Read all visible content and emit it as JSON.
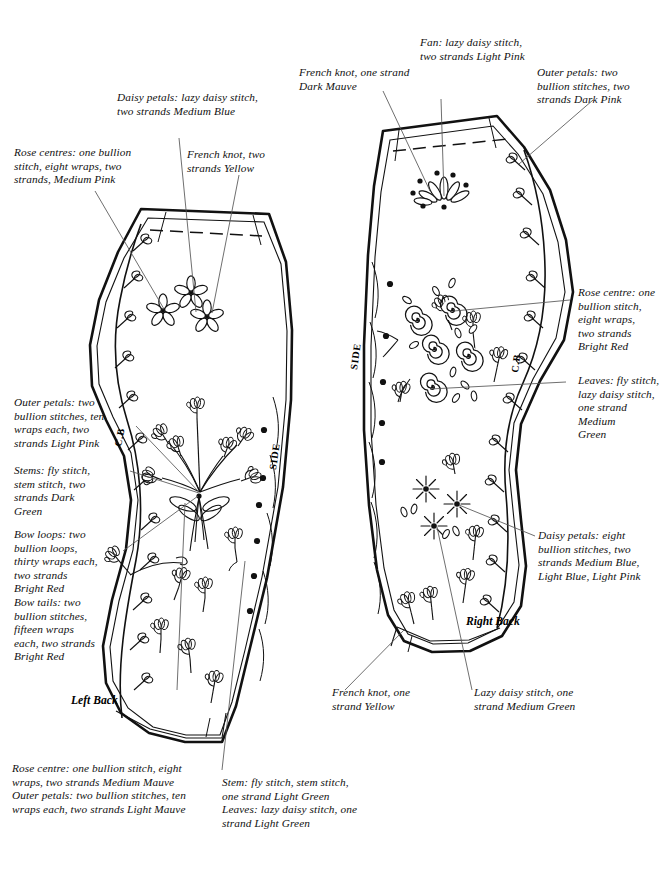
{
  "document": {
    "type": "embroidery-placement-diagram",
    "background_color": "#ffffff",
    "ink_color": "#111111"
  },
  "pieces": [
    {
      "id": "left-back",
      "name": "Left Back",
      "center_back_mark": "C.B",
      "side_mark": "SIDE"
    },
    {
      "id": "right-back",
      "name": "Right Back",
      "center_back_mark": "C.B",
      "side_mark": "SIDE"
    }
  ],
  "labels": {
    "daisy_petals_medium_blue": "Daisy petals: lazy daisy stitch,\ntwo strands Medium Blue",
    "rose_centres_medium_pink": "Rose centres: one bullion\nstitch, eight wraps, two\nstrands, Medium Pink",
    "french_knot_yellow_two": "French knot, two\nstrands Yellow",
    "french_knot_dark_mauve": "French knot, one strand\nDark Mauve",
    "fan_light_pink": "Fan: lazy daisy stitch,\ntwo strands Light Pink",
    "outer_petals_dark_pink": "Outer petals: two\nbullion stitches, two\nstrands Dark Pink",
    "rose_centre_bright_red": "Rose centre: one\nbullion stitch,\neight wraps,\ntwo strands\nBright Red",
    "leaves_medium_green": "Leaves: fly stitch,\nlazy daisy stitch,\none strand Medium\nGreen",
    "outer_petals_light_pink": "Outer petals: two\nbullion stitches, ten\nwraps each, two\nstrands Light Pink",
    "stems_dark_green": "Stems: fly stitch,\nstem stitch, two\nstrands Dark\nGreen",
    "bow_loops_tails_bright_red": "Bow loops: two\nbullion loops,\nthirty wraps each,\ntwo strands\nBright Red\nBow tails: two\nbullion stitches,\nfifteen wraps\neach, two strands\nBright Red",
    "daisy_petals_eight_bullion": "Daisy petals: eight\nbullion stitches, two\nstrands Medium Blue,\nLight Blue, Light Pink",
    "rose_medium_light_mauve": "Rose centre: one bullion stitch, eight\nwraps, two strands Medium Mauve\nOuter petals: two bullion stitches, ten\nwraps each, two strands Light Mauve",
    "stem_leaves_light_green": "Stem: fly stitch, stem stitch,\none strand Light Green\nLeaves: lazy daisy stitch, one\nstrand Light Green",
    "french_knot_yellow_one": "French knot, one\nstrand Yellow",
    "lazy_daisy_medium_green": "Lazy daisy stitch, one\nstrand Medium Green"
  }
}
